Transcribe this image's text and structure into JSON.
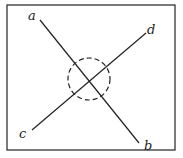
{
  "diagram": {
    "type": "intersecting-lines-with-dashed-circle",
    "frame": {
      "x": 7,
      "y": 5,
      "width": 168,
      "height": 145,
      "stroke": "#333333"
    },
    "lines": [
      {
        "id": "ab",
        "from_label": "a",
        "to_label": "b",
        "x1": 40,
        "y1": 20,
        "x2": 139,
        "y2": 143
      },
      {
        "id": "cd",
        "from_label": "c",
        "to_label": "d",
        "x1": 32,
        "y1": 130,
        "x2": 146,
        "y2": 33
      }
    ],
    "labels": {
      "a": "a",
      "b": "b",
      "c": "c",
      "d": "d"
    },
    "circle": {
      "cx": 89,
      "cy": 79,
      "r": 21,
      "style": "dashed"
    },
    "ink_color": "#222222"
  }
}
